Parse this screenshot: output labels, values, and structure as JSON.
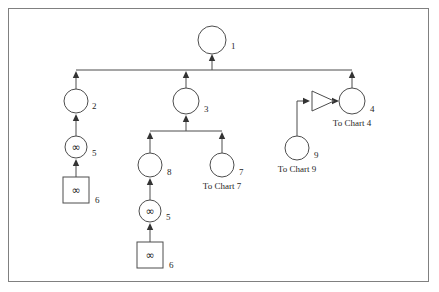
{
  "diagram": {
    "frame": {
      "visible": true,
      "color": "#808080"
    },
    "colors": {
      "stroke": "#4d4d4d",
      "arrow": "#333333",
      "text": "#262626",
      "background": "#ffffff"
    },
    "nodes": [
      {
        "id": "node-1",
        "shape": "circle",
        "index": "1",
        "glyph": "",
        "caption": "",
        "cx": 212,
        "cy": 40,
        "r": 14,
        "index_x": 231,
        "index_y": 47,
        "caption_x": 212,
        "caption_y": 62
      },
      {
        "id": "node-2",
        "shape": "circle",
        "index": "2",
        "glyph": "",
        "caption": "",
        "cx": 76,
        "cy": 101,
        "r": 12,
        "index_x": 92,
        "index_y": 107,
        "caption_x": 76,
        "caption_y": 120
      },
      {
        "id": "node-5-left",
        "shape": "circle",
        "index": "5",
        "glyph": "∞",
        "caption": "",
        "cx": 76,
        "cy": 147,
        "r": 11,
        "index_x": 92,
        "index_y": 154,
        "caption_x": 76,
        "caption_y": 166
      },
      {
        "id": "node-6-left",
        "shape": "square",
        "index": "6",
        "glyph": "∞",
        "caption": "",
        "cx": 76,
        "cy": 190,
        "r": 13,
        "index_x": 95,
        "index_y": 201,
        "caption_x": 76,
        "caption_y": 212
      },
      {
        "id": "node-3",
        "shape": "circle",
        "index": "3",
        "glyph": "",
        "caption": "",
        "cx": 186,
        "cy": 101,
        "r": 13,
        "index_x": 204,
        "index_y": 110,
        "caption_x": 186,
        "caption_y": 122
      },
      {
        "id": "node-8",
        "shape": "circle",
        "index": "8",
        "glyph": "",
        "caption": "",
        "cx": 150,
        "cy": 165,
        "r": 12,
        "index_x": 167,
        "index_y": 173,
        "caption_x": 150,
        "caption_y": 186
      },
      {
        "id": "node-5-mid",
        "shape": "circle",
        "index": "5",
        "glyph": "∞",
        "caption": "",
        "cx": 150,
        "cy": 211,
        "r": 11,
        "index_x": 166,
        "index_y": 218,
        "caption_x": 150,
        "caption_y": 230
      },
      {
        "id": "node-6-mid",
        "shape": "square",
        "index": "6",
        "glyph": "∞",
        "caption": "",
        "cx": 150,
        "cy": 255,
        "r": 13,
        "index_x": 169,
        "index_y": 266,
        "caption_x": 150,
        "caption_y": 277
      },
      {
        "id": "node-7",
        "shape": "circle",
        "index": "7",
        "glyph": "",
        "caption": "To Chart 7",
        "cx": 222,
        "cy": 165,
        "r": 12,
        "index_x": 239,
        "index_y": 173,
        "caption_x": 222,
        "caption_y": 187
      },
      {
        "id": "node-4",
        "shape": "circle",
        "index": "4",
        "glyph": "",
        "caption": "To Chart 4",
        "cx": 352,
        "cy": 101,
        "r": 13,
        "index_x": 370,
        "index_y": 110,
        "caption_x": 352,
        "caption_y": 124
      },
      {
        "id": "node-9",
        "shape": "circle",
        "index": "9",
        "glyph": "",
        "caption": "To Chart 9",
        "cx": 297,
        "cy": 148,
        "r": 12,
        "index_x": 314,
        "index_y": 156,
        "caption_x": 297,
        "caption_y": 170
      }
    ],
    "gates": [
      {
        "id": "gate-triangle",
        "shape": "triangle",
        "label": "",
        "x1": 312,
        "y1": 91,
        "x2": 312,
        "y2": 111,
        "x3": 334,
        "y3": 101
      }
    ],
    "edges": [
      {
        "id": "edge-bus-to-1",
        "path": "M 212 70 L 212 57",
        "arrow": "up",
        "ax": 212,
        "ay": 54
      },
      {
        "id": "edge-bus-horizontal",
        "path": "M 76 70 L 352 70",
        "arrow": "none"
      },
      {
        "id": "edge-2-to-bus",
        "path": "M 76 89 L 76 73",
        "arrow": "up",
        "ax": 76,
        "ay": 71
      },
      {
        "id": "edge-3-to-bus",
        "path": "M 186 88 L 186 73",
        "arrow": "up",
        "ax": 186,
        "ay": 71
      },
      {
        "id": "edge-4-to-bus",
        "path": "M 352 88 L 352 73",
        "arrow": "up",
        "ax": 352,
        "ay": 71
      },
      {
        "id": "edge-5left-to-2",
        "path": "M 76 136 L 76 117",
        "arrow": "up",
        "ax": 76,
        "ay": 114
      },
      {
        "id": "edge-6left-to-5left",
        "path": "M 76 177 L 76 161",
        "arrow": "up",
        "ax": 76,
        "ay": 159
      },
      {
        "id": "edge-subbus-to-3",
        "path": "M 186 131 L 186 118",
        "arrow": "up",
        "ax": 186,
        "ay": 115
      },
      {
        "id": "edge-subbus-horizontal",
        "path": "M 150 131 L 222 131",
        "arrow": "none"
      },
      {
        "id": "edge-8-to-subbus",
        "path": "M 150 153 L 150 134",
        "arrow": "up",
        "ax": 150,
        "ay": 132
      },
      {
        "id": "edge-7-to-subbus",
        "path": "M 222 153 L 222 134",
        "arrow": "up",
        "ax": 222,
        "ay": 132
      },
      {
        "id": "edge-5mid-to-8",
        "path": "M 150 200 L 150 181",
        "arrow": "up",
        "ax": 150,
        "ay": 178
      },
      {
        "id": "edge-6mid-to-5mid",
        "path": "M 150 242 L 150 225",
        "arrow": "up",
        "ax": 150,
        "ay": 223
      },
      {
        "id": "edge-9-to-gate",
        "path": "M 297 136 L 297 101 L 307 101",
        "arrow": "right",
        "ax": 310,
        "ay": 101
      },
      {
        "id": "edge-gate-to-4",
        "path": "M 334 101 L 336 101",
        "arrow": "right",
        "ax": 339,
        "ay": 101
      }
    ]
  }
}
